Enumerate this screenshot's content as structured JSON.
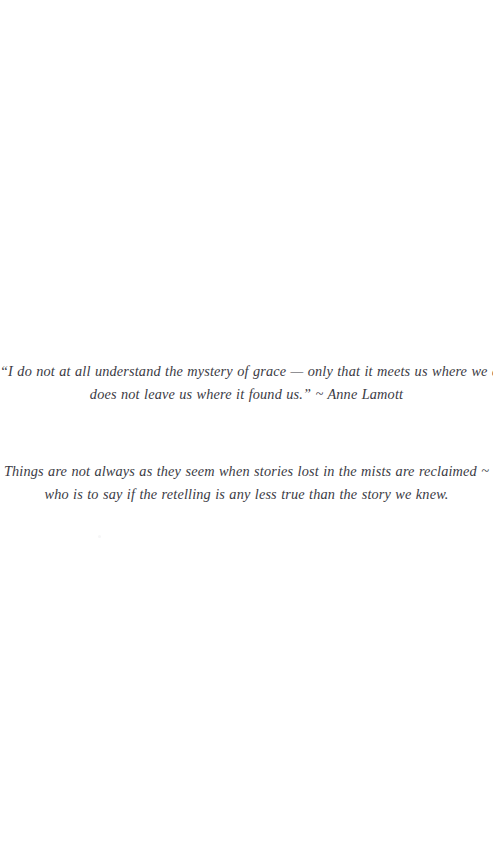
{
  "page": {
    "background_color": "#ffffff",
    "ink_color": "#2b2b33",
    "kind": "scanned-book-epigraph-page"
  },
  "quote_block": {
    "name": "epigraph-quote",
    "line1": "“I do not at all understand the mystery of grace — only that it meets us where we are but",
    "line2": "does not leave us where it found us.” ~ Anne Lamott",
    "attribution": "Anne Lamott"
  },
  "reflection_block": {
    "name": "reflection-passage",
    "line1": "Things are not always as they seem when stories lost in the mists are reclaimed ~",
    "line2": "who is to say if the retelling is any less true than the story we knew."
  }
}
